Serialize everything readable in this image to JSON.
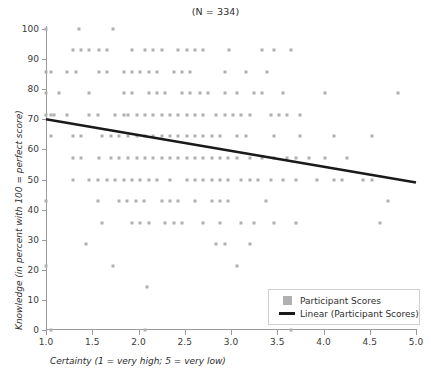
{
  "chart_data": {
    "type": "scatter",
    "title": "(N = 334)",
    "title_n_label": "N",
    "title_n_value": "334",
    "xlabel": "Certainty (1 = very high; 5 = very low)",
    "ylabel": "Knowledge (in percent with 100 = perfect score)",
    "xlim": [
      1.0,
      5.0
    ],
    "ylim": [
      0,
      100
    ],
    "grid": false,
    "xticks": [
      "1.0",
      "1.5",
      "2.0",
      "2.5",
      "3.0",
      "3.5",
      "4.0",
      "4.5",
      "5.0"
    ],
    "xtick_values": [
      1.0,
      1.5,
      2.0,
      2.5,
      3.0,
      3.5,
      4.0,
      4.5,
      5.0
    ],
    "yticks": [
      "0",
      "10",
      "20",
      "30",
      "40",
      "50",
      "60",
      "70",
      "80",
      "90",
      "100"
    ],
    "ytick_values": [
      0,
      10,
      20,
      30,
      40,
      50,
      60,
      70,
      80,
      90,
      100
    ],
    "legend_position": "bottom-right",
    "marker_color": "#b0b0b0",
    "line_color": "#1a1a1a",
    "axis_color": "#9a9a9a",
    "series": [
      {
        "name": "Participant Scores",
        "type": "scatter",
        "points": [
          [
            1.0,
            100.0
          ],
          [
            1.36,
            100.0
          ],
          [
            1.72,
            100.0
          ],
          [
            1.29,
            92.9
          ],
          [
            1.38,
            92.9
          ],
          [
            1.47,
            92.9
          ],
          [
            1.57,
            92.9
          ],
          [
            1.66,
            92.9
          ],
          [
            1.93,
            92.9
          ],
          [
            2.07,
            92.9
          ],
          [
            2.16,
            92.9
          ],
          [
            2.25,
            92.9
          ],
          [
            2.43,
            92.9
          ],
          [
            2.52,
            92.9
          ],
          [
            2.61,
            92.9
          ],
          [
            2.7,
            92.9
          ],
          [
            2.98,
            92.9
          ],
          [
            3.34,
            92.9
          ],
          [
            3.47,
            92.9
          ],
          [
            3.65,
            92.9
          ],
          [
            1.0,
            85.7
          ],
          [
            1.05,
            85.7
          ],
          [
            1.23,
            85.7
          ],
          [
            1.32,
            85.7
          ],
          [
            1.57,
            85.7
          ],
          [
            1.66,
            85.7
          ],
          [
            1.84,
            85.7
          ],
          [
            1.93,
            85.7
          ],
          [
            2.02,
            85.7
          ],
          [
            2.11,
            85.7
          ],
          [
            2.2,
            85.7
          ],
          [
            2.38,
            85.7
          ],
          [
            2.47,
            85.7
          ],
          [
            2.56,
            85.7
          ],
          [
            2.93,
            85.7
          ],
          [
            3.16,
            85.7
          ],
          [
            3.39,
            85.7
          ],
          [
            1.0,
            78.6
          ],
          [
            1.14,
            78.6
          ],
          [
            1.47,
            78.6
          ],
          [
            1.84,
            78.6
          ],
          [
            1.93,
            78.6
          ],
          [
            2.11,
            78.6
          ],
          [
            2.2,
            78.6
          ],
          [
            2.29,
            78.6
          ],
          [
            2.47,
            78.6
          ],
          [
            2.56,
            78.6
          ],
          [
            2.66,
            78.6
          ],
          [
            2.75,
            78.6
          ],
          [
            2.93,
            78.6
          ],
          [
            3.07,
            78.6
          ],
          [
            3.25,
            78.6
          ],
          [
            3.34,
            78.6
          ],
          [
            3.56,
            78.6
          ],
          [
            4.02,
            78.6
          ],
          [
            4.8,
            78.6
          ],
          [
            1.0,
            71.4
          ],
          [
            1.05,
            71.4
          ],
          [
            1.09,
            71.4
          ],
          [
            1.23,
            71.4
          ],
          [
            1.47,
            71.4
          ],
          [
            1.56,
            71.4
          ],
          [
            1.75,
            71.4
          ],
          [
            1.84,
            71.4
          ],
          [
            1.89,
            71.4
          ],
          [
            1.98,
            71.4
          ],
          [
            2.07,
            71.4
          ],
          [
            2.16,
            71.4
          ],
          [
            2.25,
            71.4
          ],
          [
            2.34,
            71.4
          ],
          [
            2.43,
            71.4
          ],
          [
            2.52,
            71.4
          ],
          [
            2.61,
            71.4
          ],
          [
            2.7,
            71.4
          ],
          [
            2.84,
            71.4
          ],
          [
            2.93,
            71.4
          ],
          [
            3.02,
            71.4
          ],
          [
            3.11,
            71.4
          ],
          [
            3.2,
            71.4
          ],
          [
            3.43,
            71.4
          ],
          [
            3.52,
            71.4
          ],
          [
            3.61,
            71.4
          ],
          [
            3.75,
            71.4
          ],
          [
            1.05,
            64.3
          ],
          [
            1.29,
            64.3
          ],
          [
            1.38,
            64.3
          ],
          [
            1.61,
            64.3
          ],
          [
            1.7,
            64.3
          ],
          [
            1.79,
            64.3
          ],
          [
            1.89,
            64.3
          ],
          [
            1.98,
            64.3
          ],
          [
            2.07,
            64.3
          ],
          [
            2.16,
            64.3
          ],
          [
            2.25,
            64.3
          ],
          [
            2.34,
            64.3
          ],
          [
            2.43,
            64.3
          ],
          [
            2.52,
            64.3
          ],
          [
            2.61,
            64.3
          ],
          [
            2.7,
            64.3
          ],
          [
            2.79,
            64.3
          ],
          [
            2.88,
            64.3
          ],
          [
            3.07,
            64.3
          ],
          [
            3.16,
            64.3
          ],
          [
            3.47,
            64.3
          ],
          [
            3.75,
            64.3
          ],
          [
            4.11,
            64.3
          ],
          [
            4.52,
            64.3
          ],
          [
            1.29,
            57.1
          ],
          [
            1.38,
            57.1
          ],
          [
            1.57,
            57.1
          ],
          [
            1.7,
            57.1
          ],
          [
            1.79,
            57.1
          ],
          [
            1.89,
            57.1
          ],
          [
            1.98,
            57.1
          ],
          [
            2.07,
            57.1
          ],
          [
            2.16,
            57.1
          ],
          [
            2.25,
            57.1
          ],
          [
            2.34,
            57.1
          ],
          [
            2.43,
            57.1
          ],
          [
            2.52,
            57.1
          ],
          [
            2.61,
            57.1
          ],
          [
            2.7,
            57.1
          ],
          [
            2.79,
            57.1
          ],
          [
            2.88,
            57.1
          ],
          [
            2.97,
            57.1
          ],
          [
            3.06,
            57.1
          ],
          [
            3.2,
            57.1
          ],
          [
            3.34,
            57.1
          ],
          [
            3.47,
            57.1
          ],
          [
            3.61,
            57.1
          ],
          [
            3.7,
            57.1
          ],
          [
            3.84,
            57.1
          ],
          [
            4.02,
            57.1
          ],
          [
            4.25,
            57.1
          ],
          [
            1.29,
            50.0
          ],
          [
            1.47,
            50.0
          ],
          [
            1.56,
            50.0
          ],
          [
            1.66,
            50.0
          ],
          [
            1.75,
            50.0
          ],
          [
            1.84,
            50.0
          ],
          [
            1.93,
            50.0
          ],
          [
            2.02,
            50.0
          ],
          [
            2.11,
            50.0
          ],
          [
            2.2,
            50.0
          ],
          [
            2.34,
            50.0
          ],
          [
            2.52,
            50.0
          ],
          [
            2.61,
            50.0
          ],
          [
            2.7,
            50.0
          ],
          [
            2.79,
            50.0
          ],
          [
            2.88,
            50.0
          ],
          [
            2.97,
            50.0
          ],
          [
            3.11,
            50.0
          ],
          [
            3.2,
            50.0
          ],
          [
            3.29,
            50.0
          ],
          [
            3.43,
            50.0
          ],
          [
            3.56,
            50.0
          ],
          [
            3.7,
            50.0
          ],
          [
            3.93,
            50.0
          ],
          [
            4.11,
            50.0
          ],
          [
            4.2,
            50.0
          ],
          [
            4.43,
            50.0
          ],
          [
            4.52,
            50.0
          ],
          [
            1.0,
            42.9
          ],
          [
            1.56,
            42.9
          ],
          [
            1.79,
            42.9
          ],
          [
            1.88,
            42.9
          ],
          [
            1.97,
            42.9
          ],
          [
            2.06,
            42.9
          ],
          [
            2.25,
            42.9
          ],
          [
            2.34,
            42.9
          ],
          [
            2.43,
            42.9
          ],
          [
            2.61,
            42.9
          ],
          [
            2.79,
            42.9
          ],
          [
            2.88,
            42.9
          ],
          [
            2.97,
            42.9
          ],
          [
            3.38,
            42.9
          ],
          [
            4.7,
            42.9
          ],
          [
            1.61,
            35.7
          ],
          [
            1.93,
            35.7
          ],
          [
            2.02,
            35.7
          ],
          [
            2.11,
            35.7
          ],
          [
            2.29,
            35.7
          ],
          [
            2.38,
            35.7
          ],
          [
            2.47,
            35.7
          ],
          [
            2.7,
            35.7
          ],
          [
            2.88,
            35.7
          ],
          [
            3.11,
            35.7
          ],
          [
            3.25,
            35.7
          ],
          [
            3.47,
            35.7
          ],
          [
            3.7,
            35.7
          ],
          [
            4.61,
            35.7
          ],
          [
            1.43,
            28.6
          ],
          [
            2.84,
            28.6
          ],
          [
            2.93,
            28.6
          ],
          [
            3.2,
            28.6
          ],
          [
            1.0,
            21.4
          ],
          [
            1.72,
            21.4
          ],
          [
            3.07,
            21.4
          ],
          [
            2.09,
            14.3
          ],
          [
            1.05,
            0.0
          ],
          [
            2.07,
            0.0
          ],
          [
            3.65,
            0.0
          ]
        ]
      },
      {
        "name": "Linear (Participant Scores)",
        "type": "line",
        "fit": "linear",
        "x_start": 1.0,
        "y_start": 70.0,
        "x_end": 5.0,
        "y_end": 49.0
      }
    ],
    "legend": [
      {
        "label": "Participant Scores",
        "marker": "square",
        "color": "#b0b0b0"
      },
      {
        "label": "Linear (Participant Scores)",
        "marker": "line",
        "color": "#1a1a1a"
      }
    ]
  }
}
